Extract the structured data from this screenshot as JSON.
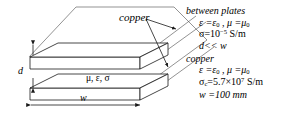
{
  "figure": {
    "stroke_color": "#1a1a1a",
    "face_color": "#ffffff",
    "background": "#ffffff"
  },
  "callouts": {
    "copper_pointer_label": "copper",
    "between_plates_material": "μ, ε, σ"
  },
  "dimensions": {
    "separation_label": "d",
    "width_label": "w"
  },
  "annotations": {
    "between_plates": {
      "heading": "between plates",
      "line1_prefix": "ε =ε",
      "line1_sub": "0",
      "line1_mid": " , μ =μ",
      "line1_sub2": "0",
      "line2_prefix": "σ=10",
      "line2_sup": "−5",
      "line2_suffix": " S/m",
      "line3": "d<< w"
    },
    "copper": {
      "heading": "copper",
      "line1_prefix": "ε =ε",
      "line1_sub": "0",
      "line1_mid": " , μ =μ",
      "line1_sub2": "0",
      "line2_prefix": "σ",
      "line2_sub": "c",
      "line2_mid": "=5.7×10",
      "line2_sup": "7",
      "line2_suffix": "  S/m",
      "line3": "w =100 mm"
    }
  }
}
